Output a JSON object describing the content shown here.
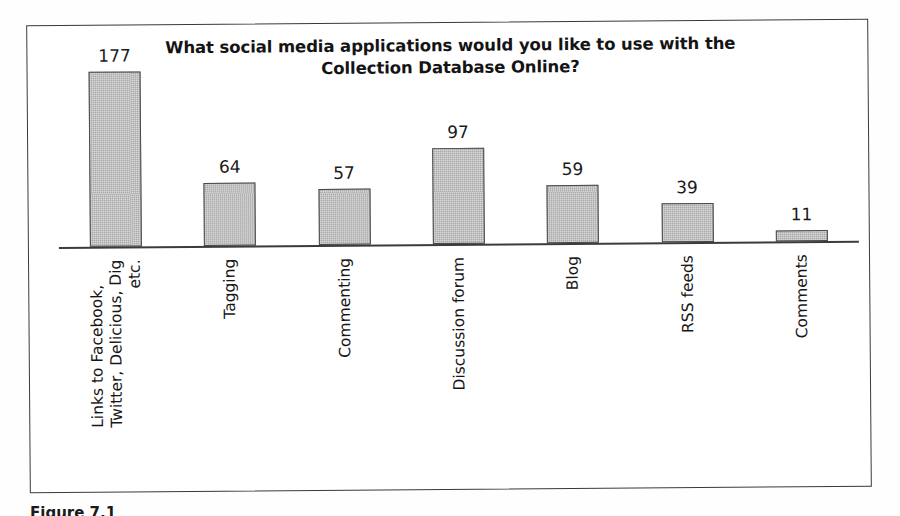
{
  "figure": {
    "caption": "Figure 7.1",
    "frame_color": "#3a3a3a"
  },
  "chart_data": {
    "type": "bar",
    "title": "What social media applications would you like to use with the Collection Database Online?",
    "title_lines": [
      "What social media applications would you like to use with the",
      "Collection Database Online?"
    ],
    "categories": [
      "Links to Facebook, Twitter, Delicious, Dig etc.",
      "Tagging",
      "Commenting",
      "Discussion forum",
      "Blog",
      "RSS feeds",
      "Comments"
    ],
    "category_label_lines": [
      [
        "Links to Facebook,",
        "Twitter, Delicious, Dig",
        "etc."
      ],
      [
        "Tagging"
      ],
      [
        "Commenting"
      ],
      [
        "Discussion forum"
      ],
      [
        "Blog"
      ],
      [
        "RSS feeds"
      ],
      [
        "Comments"
      ]
    ],
    "values": [
      177,
      64,
      57,
      97,
      59,
      39,
      11
    ],
    "value_labels": [
      "177",
      "64",
      "57",
      "97",
      "59",
      "39",
      "11"
    ],
    "xlabel": "",
    "ylabel": "",
    "ylim": [
      0,
      177
    ],
    "grid": false,
    "legend": false,
    "bar_fill_color": "#a9a9a9",
    "bar_border_color": "#4a4a4a",
    "axis_color": "#3b3b3b"
  }
}
